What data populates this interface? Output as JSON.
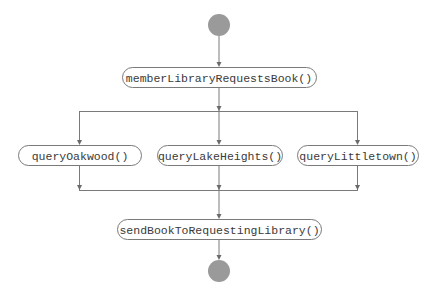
{
  "diagram": {
    "type": "activity-diagram",
    "colors": {
      "terminal_fill": "#9a9a9a",
      "stroke": "#7a7a7a",
      "text": "#3a3a3a",
      "background": "#ffffff"
    },
    "start": {
      "id": "start",
      "cx": 219,
      "cy": 25,
      "r": 11
    },
    "end": {
      "id": "end",
      "cx": 219,
      "cy": 271,
      "r": 11
    },
    "nodes": [
      {
        "id": "memberLibraryRequestsBook",
        "label": "memberLibraryRequestsBook()",
        "x": 122,
        "y": 67,
        "w": 194,
        "h": 20
      },
      {
        "id": "queryOakwood",
        "label": "queryOakwood()",
        "x": 18,
        "y": 145,
        "w": 123,
        "h": 20
      },
      {
        "id": "queryLakeHeights",
        "label": "queryLakeHeights()",
        "x": 157,
        "y": 145,
        "w": 125,
        "h": 20
      },
      {
        "id": "queryLittletown",
        "label": "queryLittletown()",
        "x": 297,
        "y": 145,
        "w": 121,
        "h": 20
      },
      {
        "id": "sendBookToRequestingLibrary",
        "label": "sendBookToRequestingLibrary()",
        "x": 117,
        "y": 219,
        "w": 204,
        "h": 20
      }
    ],
    "fork_bar": {
      "y": 111,
      "x1": 79,
      "x2": 358
    },
    "join_bar": {
      "y": 190,
      "x1": 79,
      "x2": 358
    },
    "edges": [
      {
        "from": "start",
        "to": "memberLibraryRequestsBook"
      },
      {
        "from": "memberLibraryRequestsBook",
        "to": "fork"
      },
      {
        "from": "fork",
        "to": "queryOakwood"
      },
      {
        "from": "fork",
        "to": "queryLakeHeights"
      },
      {
        "from": "fork",
        "to": "queryLittletown"
      },
      {
        "from": "queryOakwood",
        "to": "join"
      },
      {
        "from": "queryLakeHeights",
        "to": "join"
      },
      {
        "from": "queryLittletown",
        "to": "join"
      },
      {
        "from": "join",
        "to": "sendBookToRequestingLibrary"
      },
      {
        "from": "sendBookToRequestingLibrary",
        "to": "end"
      }
    ]
  }
}
